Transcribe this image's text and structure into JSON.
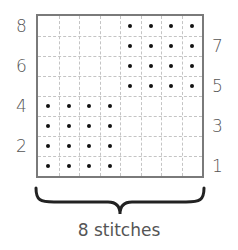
{
  "chart": {
    "title": "",
    "columns": 8,
    "rows": 8,
    "row_labels_left": [
      {
        "label": "8",
        "row": 8
      },
      {
        "label": "6",
        "row": 6
      },
      {
        "label": "4",
        "row": 4
      },
      {
        "label": "2",
        "row": 2
      }
    ],
    "row_labels_right": [
      {
        "label": "7",
        "row": 7
      },
      {
        "label": "5",
        "row": 5
      },
      {
        "label": "3",
        "row": 3
      },
      {
        "label": "1",
        "row": 1
      }
    ],
    "dotted_cells": {
      "rows_1_to_4": {
        "columns": [
          1,
          2,
          3,
          4
        ]
      },
      "rows_5_to_8": {
        "columns": [
          5,
          6,
          7,
          8
        ]
      }
    },
    "caption": "8 stitches"
  }
}
